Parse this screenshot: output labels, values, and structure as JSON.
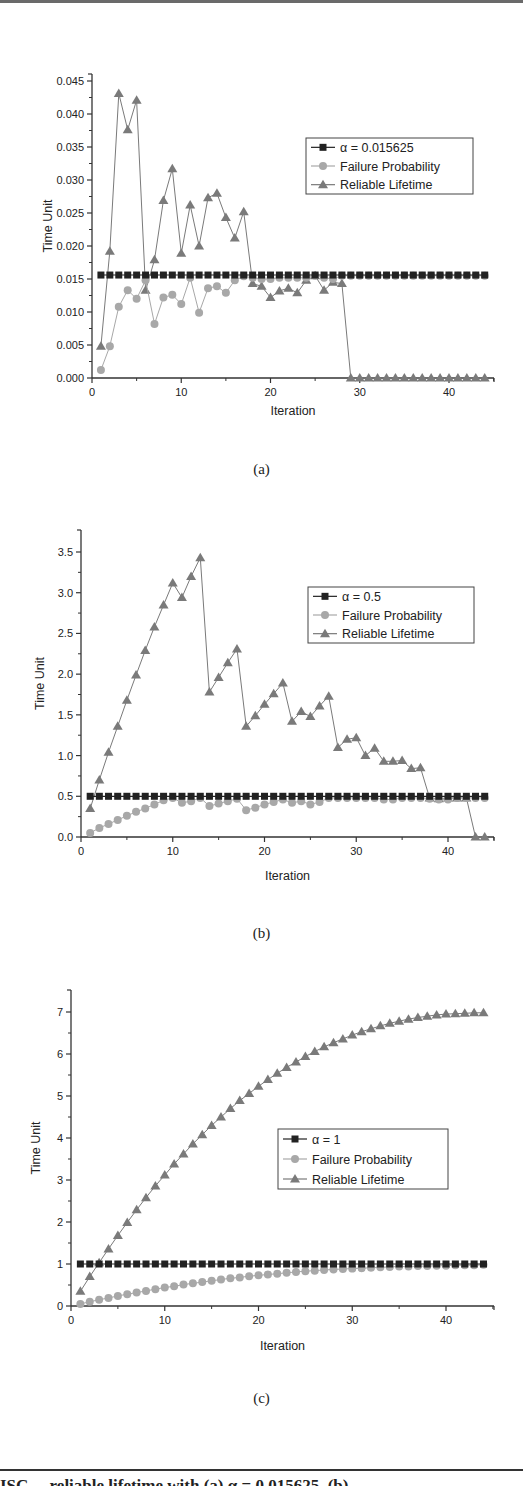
{
  "figure": {
    "sublabels": [
      "(a)",
      "(b)",
      "(c)"
    ],
    "caption_fragment": "ISC ... reliable lifetime with (a) α = 0.015625, (b) ..."
  },
  "colors": {
    "alpha_series": "#222222",
    "failure_probability": "#a8a8a8",
    "reliable_lifetime": "#7a7a7a",
    "axis": "#333333"
  },
  "chart_data": [
    {
      "type": "line",
      "panel": "(a)",
      "title": "",
      "xlabel": "Iteration",
      "ylabel": "Time Unit",
      "xlim": [
        0,
        45
      ],
      "ylim": [
        0,
        0.045
      ],
      "xticks": [
        0,
        10,
        20,
        30,
        40
      ],
      "xtick_labels": [
        "0",
        "10",
        "20",
        "30",
        "40"
      ],
      "yticks": [
        0,
        0.005,
        0.01,
        0.015,
        0.02,
        0.025,
        0.03,
        0.035,
        0.04,
        0.045
      ],
      "ytick_labels": [
        "0.000",
        "0.005",
        "0.010",
        "0.015",
        "0.020",
        "0.025",
        "0.030",
        "0.035",
        "0.040",
        "0.045"
      ],
      "grid": false,
      "legend_position": "upper right",
      "legend": [
        "α = 0.015625",
        "Failure Probability",
        "Reliable Lifetime"
      ],
      "x": [
        1,
        2,
        3,
        4,
        5,
        6,
        7,
        8,
        9,
        10,
        11,
        12,
        13,
        14,
        15,
        16,
        17,
        18,
        19,
        20,
        21,
        22,
        23,
        24,
        25,
        26,
        27,
        28,
        29,
        30,
        31,
        32,
        33,
        34,
        35,
        36,
        37,
        38,
        39,
        40,
        41,
        42,
        43,
        44
      ],
      "series": [
        {
          "name": "α = 0.015625",
          "marker": "square",
          "values": [
            0.0156,
            0.0156,
            0.0156,
            0.0156,
            0.0156,
            0.0156,
            0.0156,
            0.0156,
            0.0156,
            0.0156,
            0.0156,
            0.0156,
            0.0156,
            0.0156,
            0.0156,
            0.0156,
            0.0156,
            0.0156,
            0.0156,
            0.0156,
            0.0156,
            0.0156,
            0.0156,
            0.0156,
            0.0156,
            0.0156,
            0.0156,
            0.0156,
            0.0156,
            0.0156,
            0.0156,
            0.0156,
            0.0156,
            0.0156,
            0.0156,
            0.0156,
            0.0156,
            0.0156,
            0.0156,
            0.0156,
            0.0156,
            0.0156,
            0.0156,
            0.0156
          ]
        },
        {
          "name": "Failure Probability",
          "marker": "circle",
          "values": [
            0.0012,
            0.0048,
            0.0108,
            0.0133,
            0.012,
            0.0148,
            0.0082,
            0.0122,
            0.0126,
            0.0112,
            0.0152,
            0.0099,
            0.0136,
            0.0139,
            0.0129,
            0.0148,
            0.0154,
            0.0152,
            0.015,
            0.015,
            0.0152,
            0.0152,
            0.0152,
            0.0152,
            0.0155,
            0.0152,
            0.015,
            0.0155,
            0.0155,
            0.0155,
            0.0155,
            0.0155,
            0.0155,
            0.0155,
            0.0155,
            0.0155,
            0.0155,
            0.0155,
            0.0155,
            0.0155,
            0.0155,
            0.0155,
            0.0155,
            0.0155
          ]
        },
        {
          "name": "Reliable Lifetime",
          "marker": "triangle",
          "values": [
            0.0048,
            0.0192,
            0.0431,
            0.0376,
            0.0421,
            0.0133,
            0.0179,
            0.0269,
            0.0317,
            0.0189,
            0.0262,
            0.02,
            0.0273,
            0.028,
            0.0243,
            0.0212,
            0.0252,
            0.0143,
            0.0139,
            0.0122,
            0.0132,
            0.0136,
            0.0129,
            0.0148,
            0.0155,
            0.0133,
            0.0145,
            0.0143,
            0.0,
            0.0,
            0.0,
            0.0,
            0.0,
            0.0,
            0.0,
            0.0,
            0.0,
            0.0,
            0.0,
            0.0,
            0.0,
            0.0,
            0.0,
            0.0
          ]
        }
      ]
    },
    {
      "type": "line",
      "panel": "(b)",
      "title": "",
      "xlabel": "Iteration",
      "ylabel": "Time Unit",
      "xlim": [
        0,
        45
      ],
      "ylim": [
        0,
        3.75
      ],
      "xticks": [
        0,
        10,
        20,
        30,
        40
      ],
      "xtick_labels": [
        "0",
        "10",
        "20",
        "30",
        "40"
      ],
      "yticks": [
        0,
        0.5,
        1.0,
        1.5,
        2.0,
        2.5,
        3.0,
        3.5
      ],
      "ytick_labels": [
        "0.0",
        "0.5",
        "1.0",
        "1.5",
        "2.0",
        "2.5",
        "3.0",
        "3.5"
      ],
      "grid": false,
      "legend_position": "upper right",
      "legend": [
        "α = 0.5",
        "Failure Probability",
        "Reliable Lifetime"
      ],
      "x": [
        1,
        2,
        3,
        4,
        5,
        6,
        7,
        8,
        9,
        10,
        11,
        12,
        13,
        14,
        15,
        16,
        17,
        18,
        19,
        20,
        21,
        22,
        23,
        24,
        25,
        26,
        27,
        28,
        29,
        30,
        31,
        32,
        33,
        34,
        35,
        36,
        37,
        38,
        39,
        40,
        41,
        42,
        43,
        44
      ],
      "series": [
        {
          "name": "α = 0.5",
          "marker": "square",
          "values": [
            0.5,
            0.5,
            0.5,
            0.5,
            0.5,
            0.5,
            0.5,
            0.5,
            0.5,
            0.5,
            0.5,
            0.5,
            0.5,
            0.5,
            0.5,
            0.5,
            0.5,
            0.5,
            0.5,
            0.5,
            0.5,
            0.5,
            0.5,
            0.5,
            0.5,
            0.5,
            0.5,
            0.5,
            0.5,
            0.5,
            0.5,
            0.5,
            0.5,
            0.5,
            0.5,
            0.5,
            0.5,
            0.5,
            0.5,
            0.5,
            0.5,
            0.5,
            0.5,
            0.5
          ]
        },
        {
          "name": "Failure Probability",
          "marker": "circle",
          "values": [
            0.05,
            0.11,
            0.16,
            0.21,
            0.26,
            0.31,
            0.35,
            0.4,
            0.45,
            0.48,
            0.42,
            0.44,
            0.48,
            0.38,
            0.41,
            0.44,
            0.47,
            0.33,
            0.36,
            0.4,
            0.43,
            0.46,
            0.42,
            0.44,
            0.4,
            0.43,
            0.48,
            0.48,
            0.48,
            0.48,
            0.48,
            0.48,
            0.46,
            0.46,
            0.48,
            0.48,
            0.48,
            0.47,
            0.46,
            0.46,
            0.48,
            0.48,
            0.48,
            0.48
          ]
        },
        {
          "name": "Reliable Lifetime",
          "marker": "triangle",
          "values": [
            0.35,
            0.7,
            1.04,
            1.36,
            1.68,
            1.99,
            2.29,
            2.58,
            2.85,
            3.12,
            2.94,
            3.2,
            3.43,
            1.78,
            1.96,
            2.14,
            2.31,
            1.36,
            1.49,
            1.63,
            1.76,
            1.89,
            1.42,
            1.54,
            1.48,
            1.61,
            1.73,
            1.1,
            1.2,
            1.22,
            1.0,
            1.09,
            0.93,
            0.93,
            0.94,
            0.84,
            0.85,
            0.48,
            0.47,
            0.48,
            0.48,
            0.48,
            0.0,
            0.0
          ]
        }
      ]
    },
    {
      "type": "line",
      "panel": "(c)",
      "title": "",
      "xlabel": "Iteration",
      "ylabel": "Time Unit",
      "xlim": [
        0,
        45
      ],
      "ylim": [
        0,
        7.5
      ],
      "xticks": [
        0,
        10,
        20,
        30,
        40
      ],
      "xtick_labels": [
        "0",
        "10",
        "20",
        "30",
        "40"
      ],
      "yticks": [
        0,
        1,
        2,
        3,
        4,
        5,
        6,
        7
      ],
      "ytick_labels": [
        "0",
        "1",
        "2",
        "3",
        "4",
        "5",
        "6",
        "7"
      ],
      "grid": false,
      "legend_position": "center right",
      "legend": [
        "α = 1",
        "Failure Probability",
        "Reliable Lifetime"
      ],
      "x": [
        1,
        2,
        3,
        4,
        5,
        6,
        7,
        8,
        9,
        10,
        11,
        12,
        13,
        14,
        15,
        16,
        17,
        18,
        19,
        20,
        21,
        22,
        23,
        24,
        25,
        26,
        27,
        28,
        29,
        30,
        31,
        32,
        33,
        34,
        35,
        36,
        37,
        38,
        39,
        40,
        41,
        42,
        43,
        44
      ],
      "series": [
        {
          "name": "α = 1",
          "marker": "square",
          "values": [
            1,
            1,
            1,
            1,
            1,
            1,
            1,
            1,
            1,
            1,
            1,
            1,
            1,
            1,
            1,
            1,
            1,
            1,
            1,
            1,
            1,
            1,
            1,
            1,
            1,
            1,
            1,
            1,
            1,
            1,
            1,
            1,
            1,
            1,
            1,
            1,
            1,
            1,
            1,
            1,
            1,
            1,
            1,
            1
          ]
        },
        {
          "name": "Failure Probability",
          "marker": "circle",
          "values": [
            0.05,
            0.1,
            0.15,
            0.19,
            0.24,
            0.28,
            0.32,
            0.36,
            0.4,
            0.44,
            0.47,
            0.51,
            0.54,
            0.57,
            0.6,
            0.63,
            0.66,
            0.68,
            0.71,
            0.73,
            0.75,
            0.77,
            0.79,
            0.81,
            0.83,
            0.84,
            0.86,
            0.87,
            0.88,
            0.89,
            0.9,
            0.91,
            0.92,
            0.93,
            0.94,
            0.94,
            0.95,
            0.95,
            0.96,
            0.96,
            0.97,
            0.97,
            0.97,
            0.98
          ]
        },
        {
          "name": "Reliable Lifetime",
          "marker": "triangle",
          "values": [
            0.35,
            0.7,
            1.03,
            1.36,
            1.68,
            1.99,
            2.29,
            2.58,
            2.86,
            3.12,
            3.38,
            3.62,
            3.86,
            4.08,
            4.3,
            4.5,
            4.7,
            4.89,
            5.06,
            5.23,
            5.39,
            5.54,
            5.68,
            5.81,
            5.94,
            6.06,
            6.17,
            6.27,
            6.36,
            6.45,
            6.53,
            6.6,
            6.67,
            6.73,
            6.78,
            6.83,
            6.87,
            6.9,
            6.93,
            6.95,
            6.96,
            6.97,
            6.98,
            6.98
          ]
        }
      ]
    }
  ]
}
